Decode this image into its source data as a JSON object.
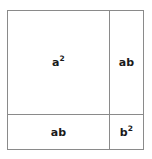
{
  "diagram": {
    "kind": "square-area-decomposition",
    "stroke_color": "#8a8a8a",
    "text_color": "#1a1a1a",
    "background_color": "#ffffff",
    "cells": [
      {
        "id": "top-left",
        "base": "a",
        "exponent": "2",
        "label": "a²"
      },
      {
        "id": "top-right",
        "base": "ab",
        "exponent": "",
        "label": "ab"
      },
      {
        "id": "bottom-left",
        "base": "ab",
        "exponent": "",
        "label": "ab"
      },
      {
        "id": "bottom-right",
        "base": "b",
        "exponent": "2",
        "label": "b²"
      }
    ]
  }
}
